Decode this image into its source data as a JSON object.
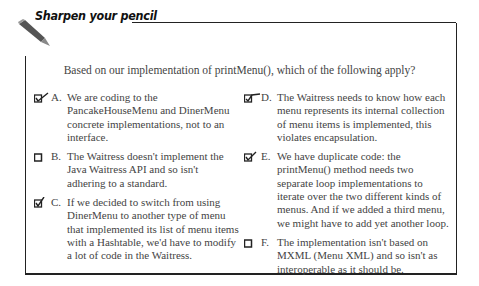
{
  "header": {
    "title": "Sharpen your pencil"
  },
  "question": "Based on our implementation of printMenu(), which of the following apply?",
  "options": [
    {
      "letter": "A.",
      "checked": true,
      "text": "We are coding to the PancakeHouseMenu and DinerMenu concrete implementations, not to an interface."
    },
    {
      "letter": "B.",
      "checked": false,
      "text": "The Waitress doesn't implement the Java Waitress API and so isn't adhering to a standard."
    },
    {
      "letter": "C.",
      "checked": true,
      "text": "If we decided to switch from using DinerMenu to another type of menu that implemented its list of menu items with a Hashtable, we'd have to modify a lot of code in the Waitress."
    },
    {
      "letter": "D.",
      "checked": true,
      "text": "The Waitress needs to know how each menu represents its internal collection of menu items is implemented, this violates encapsulation."
    },
    {
      "letter": "E.",
      "checked": true,
      "text": "We have duplicate code: the printMenu() method needs two separate loop implementations to iterate over the two different kinds of menus.  And if we added a third menu, we might have to add yet another loop."
    },
    {
      "letter": "F.",
      "checked": false,
      "text": "The implementation isn't based on MXML (Menu XML) and so isn't as interoperable as it should be."
    }
  ]
}
